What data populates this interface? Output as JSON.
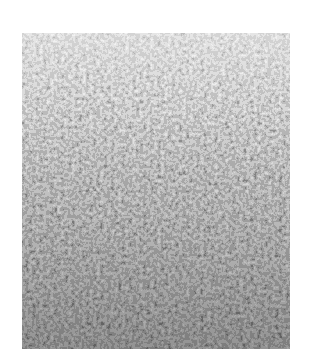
{
  "image": {
    "subject": "grayscale close-up texture of densely packed pebbles/grains",
    "alt": "Grayscale photograph of densely packed small grains, lighter at the top and darker toward the bottom",
    "colors": {
      "background": "#ffffff",
      "top_tone": "#b8b8b8",
      "bottom_tone": "#4a4a4a",
      "grain_light": "#d0d0d0",
      "grain_dark": "#2a2a2a"
    }
  }
}
